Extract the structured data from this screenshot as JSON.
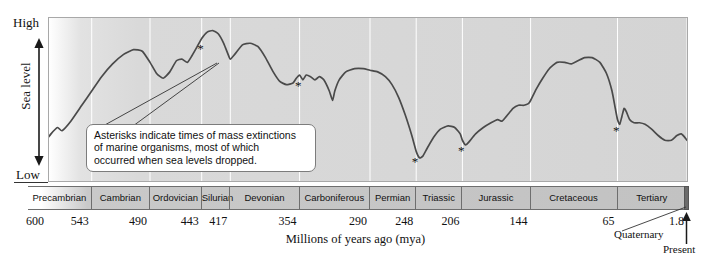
{
  "figure": {
    "y_axis": {
      "title": "Sea level",
      "high_label": "High",
      "low_label": "Low"
    },
    "x_axis": {
      "title": "Millions of years ago (mya)"
    },
    "annotation": {
      "line1": "Asterisks indicate times of mass extinctions",
      "line2": "of marine organisms, most of which",
      "line3": "occurred when sea levels dropped."
    },
    "quaternary_label": "Quaternary",
    "present_label": "Present"
  },
  "chart_data": {
    "type": "line",
    "xlabel": "Millions of years ago (mya)",
    "ylabel": "Sea level",
    "xlim": [
      600,
      0
    ],
    "ylim": [
      0,
      1
    ],
    "x_reversed": true,
    "grid": "vertical gridlines at period boundaries",
    "legend": "none",
    "ytick_labels": [
      "Low",
      "High"
    ],
    "xtick_values": [
      600,
      543,
      490,
      443,
      417,
      354,
      290,
      248,
      206,
      144,
      65,
      1.8
    ],
    "xtick_labels": [
      "600",
      "543",
      "490",
      "443",
      "417",
      "354",
      "290",
      "248",
      "206",
      "144",
      "65",
      "1.8"
    ],
    "periods": [
      {
        "name": "Precambrian",
        "start": 600,
        "end": 543
      },
      {
        "name": "Cambrian",
        "start": 543,
        "end": 490
      },
      {
        "name": "Ordovician",
        "start": 490,
        "end": 443
      },
      {
        "name": "Silurian",
        "start": 443,
        "end": 417
      },
      {
        "name": "Devonian",
        "start": 417,
        "end": 354
      },
      {
        "name": "Carboniferous",
        "start": 354,
        "end": 290
      },
      {
        "name": "Permian",
        "start": 290,
        "end": 248
      },
      {
        "name": "Triassic",
        "start": 248,
        "end": 206
      },
      {
        "name": "Jurassic",
        "start": 206,
        "end": 144
      },
      {
        "name": "Cretaceous",
        "start": 144,
        "end": 65
      },
      {
        "name": "Tertiary",
        "start": 65,
        "end": 1.8
      },
      {
        "name": "Quaternary",
        "start": 1.8,
        "end": 0
      }
    ],
    "series": [
      {
        "name": "Sea level",
        "points": [
          [
            600,
            0.13
          ],
          [
            590,
            0.2
          ],
          [
            580,
            0.29
          ],
          [
            574,
            0.33
          ],
          [
            570,
            0.31
          ],
          [
            562,
            0.37
          ],
          [
            552,
            0.47
          ],
          [
            543,
            0.56
          ],
          [
            534,
            0.65
          ],
          [
            524,
            0.73
          ],
          [
            514,
            0.79
          ],
          [
            505,
            0.82
          ],
          [
            497,
            0.81
          ],
          [
            490,
            0.74
          ],
          [
            484,
            0.67
          ],
          [
            478,
            0.64
          ],
          [
            472,
            0.68
          ],
          [
            466,
            0.75
          ],
          [
            461,
            0.76
          ],
          [
            456,
            0.74
          ],
          [
            452,
            0.78
          ],
          [
            447,
            0.84
          ],
          [
            443,
            0.89
          ],
          [
            438,
            0.93
          ],
          [
            433,
            0.94
          ],
          [
            428,
            0.92
          ],
          [
            423,
            0.86
          ],
          [
            419,
            0.79
          ],
          [
            417,
            0.76
          ],
          [
            413,
            0.79
          ],
          [
            406,
            0.85
          ],
          [
            399,
            0.86
          ],
          [
            392,
            0.84
          ],
          [
            385,
            0.77
          ],
          [
            378,
            0.68
          ],
          [
            372,
            0.62
          ],
          [
            366,
            0.6
          ],
          [
            360,
            0.61
          ],
          [
            357,
            0.64
          ],
          [
            354,
            0.66
          ],
          [
            351,
            0.63
          ],
          [
            348,
            0.66
          ],
          [
            344,
            0.65
          ],
          [
            340,
            0.63
          ],
          [
            336,
            0.65
          ],
          [
            332,
            0.63
          ],
          [
            327,
            0.56
          ],
          [
            324,
            0.5
          ],
          [
            322,
            0.56
          ],
          [
            318,
            0.63
          ],
          [
            312,
            0.68
          ],
          [
            304,
            0.7
          ],
          [
            296,
            0.7
          ],
          [
            290,
            0.69
          ],
          [
            283,
            0.68
          ],
          [
            276,
            0.65
          ],
          [
            270,
            0.6
          ],
          [
            264,
            0.52
          ],
          [
            258,
            0.41
          ],
          [
            252,
            0.28
          ],
          [
            248,
            0.18
          ],
          [
            245,
            0.14
          ],
          [
            242,
            0.15
          ],
          [
            238,
            0.2
          ],
          [
            232,
            0.27
          ],
          [
            226,
            0.32
          ],
          [
            219,
            0.34
          ],
          [
            213,
            0.33
          ],
          [
            208,
            0.29
          ],
          [
            206,
            0.25
          ],
          [
            203,
            0.22
          ],
          [
            200,
            0.24
          ],
          [
            194,
            0.29
          ],
          [
            187,
            0.33
          ],
          [
            180,
            0.36
          ],
          [
            174,
            0.38
          ],
          [
            170,
            0.37
          ],
          [
            166,
            0.4
          ],
          [
            160,
            0.45
          ],
          [
            155,
            0.47
          ],
          [
            150,
            0.47
          ],
          [
            146,
            0.48
          ],
          [
            144,
            0.5
          ],
          [
            139,
            0.57
          ],
          [
            133,
            0.64
          ],
          [
            127,
            0.7
          ],
          [
            120,
            0.74
          ],
          [
            113,
            0.74
          ],
          [
            107,
            0.73
          ],
          [
            101,
            0.75
          ],
          [
            95,
            0.77
          ],
          [
            88,
            0.77
          ],
          [
            81,
            0.74
          ],
          [
            75,
            0.67
          ],
          [
            70,
            0.56
          ],
          [
            67,
            0.45
          ],
          [
            65,
            0.38
          ],
          [
            63,
            0.35
          ],
          [
            61,
            0.4
          ],
          [
            59,
            0.45
          ],
          [
            57,
            0.43
          ],
          [
            54,
            0.38
          ],
          [
            50,
            0.36
          ],
          [
            45,
            0.36
          ],
          [
            40,
            0.35
          ],
          [
            34,
            0.32
          ],
          [
            28,
            0.28
          ],
          [
            22,
            0.25
          ],
          [
            16,
            0.25
          ],
          [
            11,
            0.28
          ],
          [
            7,
            0.29
          ],
          [
            4,
            0.27
          ],
          [
            1.8,
            0.25
          ],
          [
            0,
            0.25
          ]
        ]
      }
    ],
    "extinction_markers": [
      {
        "label": "*",
        "approx_mya": 443,
        "note": "end-Ordovician"
      },
      {
        "label": "*",
        "approx_mya": 354,
        "note": "late Devonian"
      },
      {
        "label": "*",
        "approx_mya": 248,
        "note": "end-Permian"
      },
      {
        "label": "*",
        "approx_mya": 206,
        "note": "end-Triassic"
      },
      {
        "label": "*",
        "approx_mya": 65,
        "note": "end-Cretaceous"
      }
    ]
  },
  "colors": {
    "curve": "#4a4a4a",
    "plot_background": "#d8d8d8",
    "bar_background": "#c4c4c4",
    "border": "#6e6e6e",
    "gridline": "#ffffff",
    "text": "#111111"
  }
}
